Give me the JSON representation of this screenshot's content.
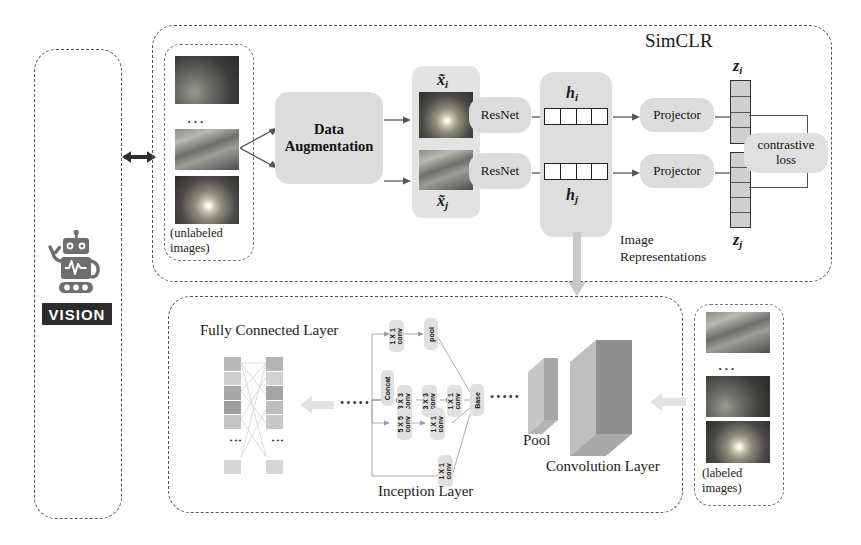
{
  "figure": {
    "simclr_label": "SimCLR"
  },
  "agent_panel": {
    "name": "vision-agent",
    "vision_label": "VISION",
    "icon": "robot-icon"
  },
  "unlabeled_panel": {
    "caption_line1": "(unlabeled",
    "caption_line2": "images)",
    "ellipsis": "...",
    "thumbnails": [
      "sky-dark",
      "sky-streak",
      "sky-sun"
    ]
  },
  "labeled_panel": {
    "caption_line1": "(labeled",
    "caption_line2": "images)",
    "ellipsis": "...",
    "thumbnails": [
      "sky-streak",
      "sky-dark",
      "sky-sun"
    ]
  },
  "simclr": {
    "augmentation": {
      "line1": "Data",
      "line2": "Augmentation"
    },
    "views": {
      "top": "x̃",
      "top_sub": "i",
      "bottom": "x̃",
      "bottom_sub": "j"
    },
    "encoders": [
      "ResNet",
      "ResNet"
    ],
    "representations": {
      "top_label": "h",
      "top_sub": "i",
      "bottom_label": "h",
      "bottom_sub": "j",
      "cells": 4,
      "caption_line1": "Image",
      "caption_line2": "Representations"
    },
    "projectors": [
      "Projector",
      "Projector"
    ],
    "embeddings": {
      "top_label": "z",
      "top_sub": "i",
      "top_cells": 4,
      "bottom_label": "z",
      "bottom_sub": "j",
      "bottom_cells": 5
    },
    "loss": {
      "line1": "contrastive",
      "line2": "loss"
    }
  },
  "downstream": {
    "fc_layer_label": "Fully Connected Layer",
    "inception_layer_label": "Inception Layer",
    "pool_label": "Pool",
    "conv_layer_label": "Convolution Layer",
    "ellipsis_left": "•••••",
    "ellipsis_right": "•••••",
    "fc_vdots": "⋮",
    "inception_blocks": [
      {
        "name": "concat",
        "text": "Concat"
      },
      {
        "name": "conv-1x1-a",
        "l1": "1 X 1",
        "l2": "conv"
      },
      {
        "name": "pool",
        "text": "pool"
      },
      {
        "name": "conv-3x3-a",
        "l1": "3 X 3",
        "l2": "conv"
      },
      {
        "name": "conv-3x3-b",
        "l1": "3 X 3",
        "l2": "conv"
      },
      {
        "name": "conv-1x1-b",
        "l1": "1 X 1",
        "l2": "conv"
      },
      {
        "name": "conv-5x5",
        "l1": "5 X 5",
        "l2": "conv"
      },
      {
        "name": "conv-1x1-c",
        "l1": "1 X 1",
        "l2": "conv"
      },
      {
        "name": "conv-1x1-d",
        "l1": "1 X 1",
        "l2": "conv"
      },
      {
        "name": "base",
        "text": "Base"
      }
    ]
  },
  "colors": {
    "box_grey": "#dcdcdc",
    "panel_border": "#555555",
    "arrow": "#555555",
    "vision_tag_bg": "#2b2b2b",
    "vector_fill": "#cfcfcf"
  }
}
